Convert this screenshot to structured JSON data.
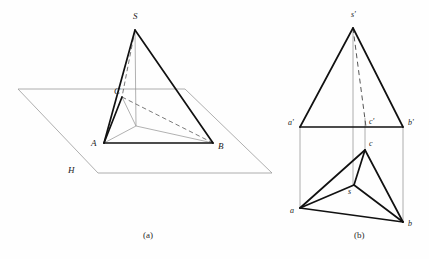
{
  "figure": {
    "background_color": "#fefefe",
    "ink_color": "#111111",
    "thin_color": "#9a9a9a",
    "captions": [
      {
        "id": "caption-a",
        "text": "(a)",
        "x": 143,
        "y": 231
      },
      {
        "id": "caption-b",
        "text": "(b)",
        "x": 354,
        "y": 231
      }
    ]
  },
  "figure_a": {
    "name": "pictorial-view",
    "plane_label": "H",
    "vertices": {
      "S": {
        "label": "S",
        "x": 135,
        "y": 30
      },
      "A": {
        "label": "A",
        "x": 104,
        "y": 143
      },
      "B": {
        "label": "B",
        "x": 213,
        "y": 143
      },
      "C": {
        "label": "C",
        "x": 122,
        "y": 97
      },
      "O": {
        "label": "",
        "x": 136,
        "y": 126
      }
    },
    "labels": [
      {
        "id": "label-S",
        "text": "S",
        "x": 133,
        "y": 12
      },
      {
        "id": "label-A",
        "text": "A",
        "x": 91,
        "y": 139
      },
      {
        "id": "label-B",
        "text": "B",
        "x": 218,
        "y": 142
      },
      {
        "id": "label-C",
        "text": "C",
        "x": 114,
        "y": 87
      },
      {
        "id": "label-H",
        "text": "H",
        "x": 68,
        "y": 166
      }
    ],
    "plane_h": {
      "description": "horizontal ground plane drawn as a gray parallelogram",
      "points": "18,89 185,89 272,173 98,173"
    },
    "solid_edges": [
      {
        "from": "S",
        "to": "A"
      },
      {
        "from": "S",
        "to": "B"
      },
      {
        "from": "A",
        "to": "B"
      },
      {
        "from": "A",
        "to": "C"
      },
      {
        "from": "C",
        "to": "S"
      }
    ],
    "hidden_edges": [
      {
        "from": "C",
        "to": "B",
        "style": "dashed"
      },
      {
        "from": "S",
        "to": "O",
        "style": "dashed-part"
      }
    ],
    "thin_edges": [
      {
        "from": "A",
        "to": "O"
      },
      {
        "from": "B",
        "to": "O"
      },
      {
        "from": "C",
        "to": "O"
      },
      {
        "from": "S",
        "to": "O"
      }
    ]
  },
  "figure_b": {
    "name": "orthographic-two-view",
    "front_view": {
      "name": "front-view",
      "vertices": {
        "s_prime": {
          "label": "s'",
          "x": 353,
          "y": 28
        },
        "a_prime": {
          "label": "a'",
          "x": 300,
          "y": 127
        },
        "b_prime": {
          "label": "b'",
          "x": 403,
          "y": 127
        },
        "c_prime": {
          "label": "c'",
          "x": 365,
          "y": 127
        }
      },
      "solid_edges": [
        {
          "from": "a_prime",
          "to": "s_prime"
        },
        {
          "from": "s_prime",
          "to": "b_prime"
        },
        {
          "from": "a_prime",
          "to": "b_prime"
        }
      ],
      "hidden_edges": [
        {
          "from": "s_prime",
          "to": "c_prime",
          "style": "dashed"
        }
      ]
    },
    "top_view": {
      "name": "top-view",
      "vertices": {
        "a": {
          "label": "a",
          "x": 300,
          "y": 208
        },
        "b": {
          "label": "b",
          "x": 403,
          "y": 222
        },
        "c": {
          "label": "c",
          "x": 365,
          "y": 150
        },
        "s": {
          "label": "s",
          "x": 354,
          "y": 185
        }
      },
      "solid_edges": [
        {
          "from": "a",
          "to": "b"
        },
        {
          "from": "b",
          "to": "c"
        },
        {
          "from": "c",
          "to": "a"
        },
        {
          "from": "a",
          "to": "s"
        },
        {
          "from": "b",
          "to": "s"
        },
        {
          "from": "c",
          "to": "s"
        }
      ]
    },
    "projection_lines": [
      {
        "id": "proj-a",
        "x": 300,
        "y1": 127,
        "y2": 208
      },
      {
        "id": "proj-c",
        "x": 365,
        "y1": 120,
        "y2": 150
      },
      {
        "id": "proj-b",
        "x": 403,
        "y1": 127,
        "y2": 222
      },
      {
        "id": "proj-s",
        "x": 353,
        "y1": 28,
        "y2": 185
      }
    ],
    "labels": [
      {
        "id": "label-s-prime",
        "text": "s'",
        "x": 351,
        "y": 11
      },
      {
        "id": "label-a-prime",
        "text": "a'",
        "x": 288,
        "y": 120
      },
      {
        "id": "label-b-prime",
        "text": "b'",
        "x": 408,
        "y": 120
      },
      {
        "id": "label-c-prime",
        "text": "c'",
        "x": 370,
        "y": 119
      },
      {
        "id": "label-a",
        "text": "a",
        "x": 291,
        "y": 209
      },
      {
        "id": "label-b",
        "text": "b",
        "x": 408,
        "y": 222
      },
      {
        "id": "label-c",
        "text": "c",
        "x": 369,
        "y": 141
      },
      {
        "id": "label-s",
        "text": "s",
        "x": 349,
        "y": 190
      }
    ]
  }
}
